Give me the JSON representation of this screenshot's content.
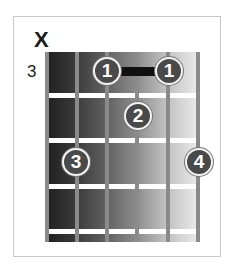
{
  "chord_diagram": {
    "muted_marker": "X",
    "start_fret_label": "3",
    "colors": {
      "board_dark": "#1e1e1e",
      "board_light": "#e9e9e9",
      "string": "#8a8a8a",
      "fret": "#ffffff",
      "finger_fill": "#4a4a4a",
      "finger_text": "#ffffff",
      "barre": "#111111"
    },
    "strings": 6,
    "frets": 4,
    "fingers": [
      {
        "label": "1",
        "string": 3,
        "fret": 1
      },
      {
        "label": "1",
        "string": 5,
        "fret": 1
      },
      {
        "label": "2",
        "string": 4,
        "fret": 2
      },
      {
        "label": "3",
        "string": 2,
        "fret": 3
      },
      {
        "label": "4",
        "string": 6,
        "fret": 3
      }
    ],
    "barre": {
      "from_string": 3,
      "to_string": 5,
      "fret": 1
    }
  }
}
